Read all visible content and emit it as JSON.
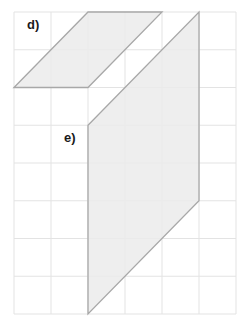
{
  "grid": {
    "origin_x": 14,
    "origin_y": 12,
    "cols": 6,
    "rows": 8,
    "cell_w": 37,
    "cell_h": 37.75,
    "line_color": "#e3e3e3"
  },
  "shapes": [
    {
      "label": "d)",
      "points_grid": [
        [
          0,
          2
        ],
        [
          2,
          0
        ],
        [
          4,
          0
        ],
        [
          2,
          2
        ]
      ],
      "fill": "#ebebeb",
      "stroke": "#a8a8a8"
    },
    {
      "label": "e)",
      "points_grid": [
        [
          2,
          3
        ],
        [
          5,
          0
        ],
        [
          5,
          5
        ],
        [
          2,
          8
        ]
      ],
      "fill": "#ebebeb",
      "stroke": "#a8a8a8"
    }
  ],
  "labels": {
    "d": "d)",
    "e": "e)"
  }
}
